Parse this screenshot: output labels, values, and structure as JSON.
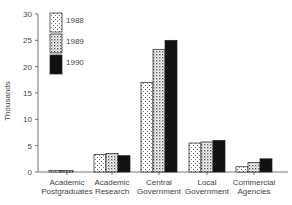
{
  "chart_data": {
    "type": "bar",
    "title": "",
    "xlabel": "",
    "ylabel": "Thousands",
    "ylim": [
      0,
      30
    ],
    "yticks": [
      0,
      5,
      10,
      15,
      20,
      25,
      30
    ],
    "grid": false,
    "legend_position": "upper-left-inside",
    "categories": [
      [
        "Academic",
        "Postgraduates"
      ],
      [
        "Academic",
        "Research"
      ],
      [
        "Central",
        "Government"
      ],
      [
        "Local",
        "Government"
      ],
      [
        "Commercial",
        "Agencies"
      ]
    ],
    "series": [
      {
        "name": "1988",
        "pattern": "sparse-dots",
        "values": [
          0.3,
          3.3,
          17,
          5.5,
          1.0
        ]
      },
      {
        "name": "1989",
        "pattern": "dense-dots",
        "values": [
          0.3,
          3.5,
          23.3,
          5.7,
          1.8
        ]
      },
      {
        "name": "1990",
        "pattern": "solid-black",
        "values": [
          0,
          3.1,
          25,
          6.0,
          2.5
        ]
      }
    ]
  },
  "labels": {
    "ylabel": "Thousands",
    "legend": [
      "1988",
      "1989",
      "1990"
    ]
  }
}
